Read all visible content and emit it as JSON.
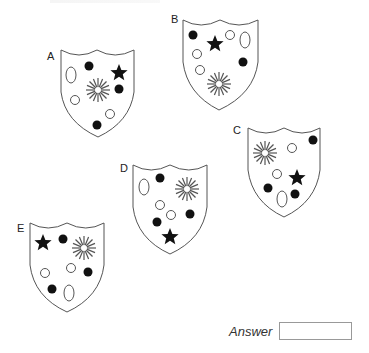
{
  "shields": [
    {
      "id": "A",
      "label": "A"
    },
    {
      "id": "B",
      "label": "B"
    },
    {
      "id": "C",
      "label": "C"
    },
    {
      "id": "D",
      "label": "D"
    },
    {
      "id": "E",
      "label": "E"
    }
  ],
  "answer": {
    "label": "Answer",
    "value": ""
  }
}
